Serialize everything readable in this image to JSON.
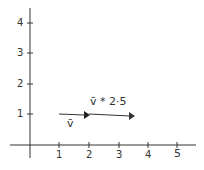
{
  "diagram": {
    "axes": {
      "x_ticks": [
        "1",
        "2",
        "3",
        "4",
        "5"
      ],
      "y_ticks": [
        "1",
        "2",
        "3",
        "4"
      ]
    },
    "vectors": [
      {
        "label": "v̄",
        "start": [
          1,
          1
        ],
        "end": [
          2,
          1
        ]
      },
      {
        "label": "v̄ * 2·5",
        "start": [
          1,
          1
        ],
        "end": [
          3.5,
          1
        ]
      }
    ],
    "stroke_color": "#333333"
  }
}
